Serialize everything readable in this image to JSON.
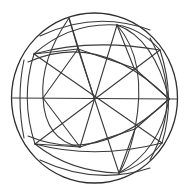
{
  "figure": {
    "stroke_color": "#3a3a3a",
    "background_color": "#ffffff",
    "center": [
      94,
      98
    ],
    "radius": 83,
    "vertices": {
      "center": [
        94,
        98
      ],
      "top": [
        117,
        25
      ],
      "upper_right": [
        160,
        50
      ],
      "right": [
        169,
        99
      ],
      "lower_right": [
        162,
        143
      ],
      "bottom": [
        119,
        173
      ],
      "lower_left": [
        35,
        144
      ],
      "upper_left": [
        34,
        54
      ],
      "inner_upper_left": [
        78,
        49
      ],
      "inner_upper_right": [
        134,
        68
      ],
      "inner_lower_right": [
        135,
        129
      ],
      "inner_lower_left": [
        80,
        147
      ],
      "left_upper_cross": [
        59,
        71
      ],
      "left_lower_cross": [
        59,
        123
      ],
      "left_equator": [
        43,
        98
      ]
    }
  }
}
